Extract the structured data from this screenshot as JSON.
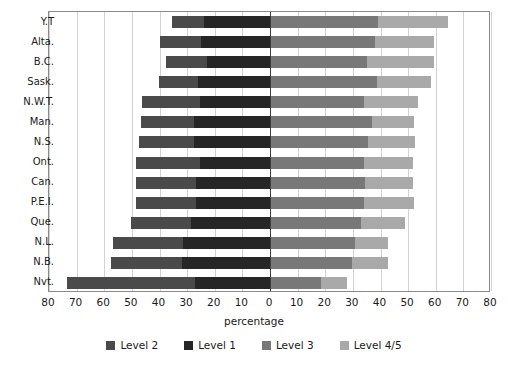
{
  "chart_data": {
    "type": "bar",
    "subtype": "diverging-stacked-horizontal",
    "title": "",
    "xlabel": "percentage",
    "ylabel": "",
    "xlim": [
      -80,
      80
    ],
    "xticks": [
      80,
      70,
      60,
      50,
      40,
      30,
      20,
      10,
      0,
      10,
      20,
      30,
      40,
      50,
      60,
      70,
      80
    ],
    "xtick_values": [
      -80,
      -70,
      -60,
      -50,
      -40,
      -30,
      -20,
      -10,
      0,
      10,
      20,
      30,
      40,
      50,
      60,
      70,
      80
    ],
    "grid": true,
    "legend_position": "bottom",
    "categories": [
      "Y.T",
      "Alta.",
      "B.C.",
      "Sask.",
      "N.W.T.",
      "Man.",
      "N.S.",
      "Ont.",
      "Can.",
      "P.E.I.",
      "Que.",
      "N.L.",
      "N.B.",
      "Nvt."
    ],
    "series": [
      {
        "name": "Level 2",
        "color": "#4a4a4a",
        "side": "left",
        "values": [
          11.5,
          14.7,
          14.7,
          13.9,
          20.8,
          19.0,
          19.7,
          23.0,
          21.5,
          21.5,
          21.5,
          25.1,
          25.5,
          46.5
        ]
      },
      {
        "name": "Level 1",
        "color": "#262626",
        "side": "left",
        "values": [
          24.0,
          25.1,
          22.9,
          26.2,
          25.5,
          27.6,
          27.6,
          25.5,
          26.9,
          26.9,
          28.7,
          31.6,
          31.9,
          27.0
        ]
      },
      {
        "name": "Level 3",
        "color": "#787878",
        "side": "right",
        "values": [
          39.0,
          38.0,
          35.1,
          38.7,
          34.1,
          36.9,
          35.5,
          34.1,
          34.4,
          34.1,
          33.0,
          30.8,
          29.8,
          18.3
        ]
      },
      {
        "name": "Level 4/5",
        "color": "#a9a9a9",
        "side": "right",
        "values": [
          25.5,
          21.5,
          24.4,
          19.7,
          19.4,
          15.4,
          16.9,
          17.6,
          17.2,
          17.9,
          15.8,
          11.8,
          12.9,
          9.7
        ]
      }
    ]
  },
  "legend": {
    "items": [
      {
        "label": "Level 2",
        "color": "#4a4a4a"
      },
      {
        "label": "Level 1",
        "color": "#262626"
      },
      {
        "label": "Level 3",
        "color": "#787878"
      },
      {
        "label": "Level 4/5",
        "color": "#a9a9a9"
      }
    ]
  },
  "axis": {
    "x_title": "percentage"
  }
}
